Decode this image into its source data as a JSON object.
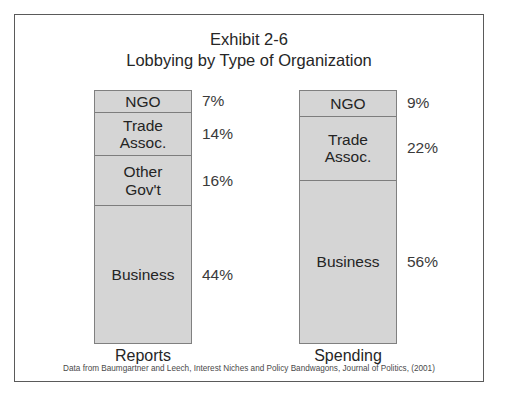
{
  "figure": {
    "title_line_1": "Exhibit 2-6",
    "title_line_2": "Lobbying by Type of Organization",
    "source_note": "Data from Baumgartner and Leech, Interest Niches and Policy Bandwagons, Journal of Politics, (2001)",
    "border_color": "#5a5a5a",
    "bar_fill_color": "#d5d5d5",
    "bar_outline_color": "#808080",
    "background_color": "#ffffff"
  },
  "chart_data": {
    "type": "bar",
    "subtitle": "Lobbying by Type of Organization",
    "xlabel": "",
    "ylabel": "",
    "grid": false,
    "legend": "none",
    "stacked": true,
    "units": "percent",
    "categories": [
      "Reports",
      "Spending"
    ],
    "series": [
      {
        "name": "NGO",
        "values": [
          7,
          9
        ]
      },
      {
        "name": "Trade Assoc.",
        "values": [
          14,
          22
        ]
      },
      {
        "name": "Other Gov't",
        "values": [
          16,
          null
        ]
      },
      {
        "name": "Business",
        "values": [
          44,
          56
        ]
      }
    ],
    "bars": [
      {
        "category": "Reports",
        "total": 81,
        "segments": [
          {
            "label": "NGO",
            "label_display": "NGO",
            "value": 7,
            "value_display": "7%"
          },
          {
            "label": "Trade Assoc.",
            "label_display": "Trade\nAssoc.",
            "value": 14,
            "value_display": "14%"
          },
          {
            "label": "Other Gov't",
            "label_display": "Other\nGov't",
            "value": 16,
            "value_display": "16%"
          },
          {
            "label": "Business",
            "label_display": "Business",
            "value": 44,
            "value_display": "44%"
          }
        ]
      },
      {
        "category": "Spending",
        "total": 87,
        "segments": [
          {
            "label": "NGO",
            "label_display": "NGO",
            "value": 9,
            "value_display": "9%"
          },
          {
            "label": "Trade Assoc.",
            "label_display": "Trade\nAssoc.",
            "value": 22,
            "value_display": "22%"
          },
          {
            "label": "Business",
            "label_display": "Business",
            "value": 56,
            "value_display": "56%"
          }
        ]
      }
    ]
  }
}
